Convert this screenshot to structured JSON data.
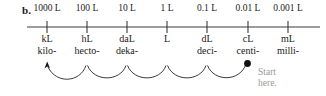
{
  "figure": {
    "part_label": "b.",
    "background_color": "#ffffff",
    "ink_color": "#1a1a1a",
    "note_color": "#9a9a9a"
  },
  "number_line": {
    "start_x": 27,
    "end_x": 320,
    "y": 27,
    "tick_half_height": 6
  },
  "ticks": [
    {
      "x": 47,
      "value_label": "1000 L",
      "symbol": "kL",
      "prefix": "kilo-",
      "marker": "arrowhead"
    },
    {
      "x": 87,
      "value_label": "100 L",
      "symbol": "hL",
      "prefix": "hecto-",
      "marker": "none"
    },
    {
      "x": 127,
      "value_label": "10 L",
      "symbol": "daL",
      "prefix": "deka-",
      "marker": "none"
    },
    {
      "x": 167,
      "value_label": "1 L",
      "symbol": "L",
      "prefix": "",
      "marker": "none"
    },
    {
      "x": 207,
      "value_label": "0.1 L",
      "symbol": "dL",
      "prefix": "deci-",
      "marker": "none"
    },
    {
      "x": 248,
      "value_label": "0.01 L",
      "symbol": "cL",
      "prefix": "centi-",
      "marker": "dot"
    },
    {
      "x": 288,
      "value_label": "0.001 L",
      "symbol": "mL",
      "prefix": "milli-",
      "marker": "none"
    }
  ],
  "hop_arcs": {
    "count": 6,
    "direction": "right-to-left",
    "from_x": 248,
    "to_x": 47,
    "baseline_y": 64,
    "depth": 14
  },
  "start_note": {
    "line1": "Start",
    "line2": "here."
  }
}
